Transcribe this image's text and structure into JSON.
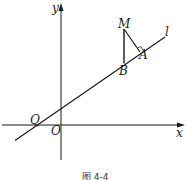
{
  "figure": {
    "caption": "图 4-4",
    "colors": {
      "stroke": "#1a1a1a",
      "background": "#ffffff"
    },
    "axes": {
      "x_label": "x",
      "y_label": "y",
      "origin_label": "O"
    },
    "line": {
      "label": "l"
    },
    "points": {
      "Q": "Q",
      "M": "M",
      "A": "A",
      "B": "B"
    },
    "annotations": {
      "right_angle_at": "A",
      "segments": [
        "MA",
        "MB"
      ]
    }
  }
}
